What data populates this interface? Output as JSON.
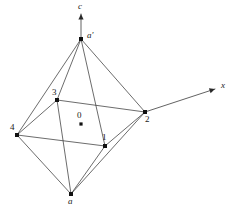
{
  "figure": {
    "background_color": "#ffffff",
    "line_color": "#3b3b3b",
    "vertex_color": "#111111",
    "width": 232,
    "height": 211
  },
  "axes": [
    {
      "id": "axis-c",
      "label": "c",
      "italic": true,
      "from": {
        "x": 81,
        "y": 39
      },
      "to": {
        "x": 81,
        "y": 14
      },
      "arrow": true,
      "label_pos": {
        "x": 78,
        "y": 2
      }
    },
    {
      "id": "axis-x",
      "label": "x",
      "italic": true,
      "from": {
        "x": 145,
        "y": 112
      },
      "to": {
        "x": 215,
        "y": 89
      },
      "arrow": true,
      "label_pos": {
        "x": 221,
        "y": 81
      }
    }
  ],
  "vertices": [
    {
      "id": "vertex-a-prime",
      "label": "a'",
      "italic": true,
      "x": 81,
      "y": 39,
      "label_pos": {
        "x": 87,
        "y": 31
      }
    },
    {
      "id": "vertex-3",
      "label": "3",
      "italic": false,
      "x": 57,
      "y": 100,
      "label_pos": {
        "x": 52,
        "y": 88
      }
    },
    {
      "id": "vertex-2",
      "label": "2",
      "italic": false,
      "x": 145,
      "y": 112,
      "label_pos": {
        "x": 145,
        "y": 115
      }
    },
    {
      "id": "vertex-4",
      "label": "4",
      "italic": false,
      "x": 17,
      "y": 135,
      "label_pos": {
        "x": 10,
        "y": 123
      }
    },
    {
      "id": "vertex-1",
      "label": "1",
      "italic": false,
      "x": 105,
      "y": 146,
      "label_pos": {
        "x": 102,
        "y": 133
      }
    },
    {
      "id": "vertex-a",
      "label": "a",
      "italic": true,
      "x": 71,
      "y": 194,
      "label_pos": {
        "x": 68,
        "y": 197
      }
    }
  ],
  "origin": {
    "id": "origin-0",
    "label": "0",
    "x": 81,
    "y": 124,
    "label_pos": {
      "x": 77,
      "y": 111
    }
  },
  "edges": [
    {
      "id": "edge-aprime-4",
      "from": "vertex-a-prime",
      "to": "vertex-4"
    },
    {
      "id": "edge-aprime-3",
      "from": "vertex-a-prime",
      "to": "vertex-3"
    },
    {
      "id": "edge-aprime-1",
      "from": "vertex-a-prime",
      "to": "vertex-1"
    },
    {
      "id": "edge-aprime-2",
      "from": "vertex-a-prime",
      "to": "vertex-2"
    },
    {
      "id": "edge-3-2",
      "from": "vertex-3",
      "to": "vertex-2"
    },
    {
      "id": "edge-3-4",
      "from": "vertex-3",
      "to": "vertex-4"
    },
    {
      "id": "edge-4-1",
      "from": "vertex-4",
      "to": "vertex-1"
    },
    {
      "id": "edge-1-2",
      "from": "vertex-1",
      "to": "vertex-2"
    },
    {
      "id": "edge-3-a",
      "from": "vertex-3",
      "to": "vertex-a"
    },
    {
      "id": "edge-4-a",
      "from": "vertex-4",
      "to": "vertex-a"
    },
    {
      "id": "edge-1-a",
      "from": "vertex-1",
      "to": "vertex-a"
    },
    {
      "id": "edge-2-a",
      "from": "vertex-2",
      "to": "vertex-a"
    }
  ]
}
